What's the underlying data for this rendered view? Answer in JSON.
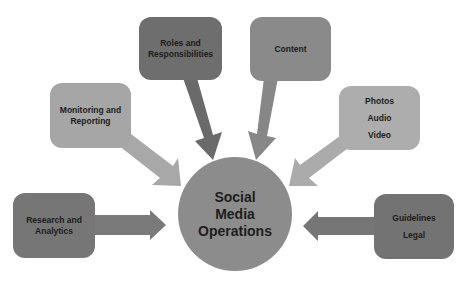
{
  "diagram": {
    "type": "hub-and-spoke",
    "center": {
      "label_lines": [
        "Social",
        "Media",
        "Operations"
      ],
      "color": "#8c8c8c"
    },
    "nodes": [
      {
        "id": "roles",
        "label_lines": [
          "Roles and",
          "Responsibilities"
        ],
        "color": "#6e6e6e",
        "arrow_color": "#6a6a6a"
      },
      {
        "id": "content",
        "label_lines": [
          "Content"
        ],
        "color": "#8a8a8a",
        "arrow_color": "#878787"
      },
      {
        "id": "monitoring",
        "label_lines": [
          "Monitoring and",
          "Reporting"
        ],
        "color": "#a6a6a6",
        "arrow_color": "#a8a8a8"
      },
      {
        "id": "media-types",
        "label_lines": [
          "Photos",
          "Audio",
          "Video"
        ],
        "color": "#adadad",
        "arrow_color": "#ababab"
      },
      {
        "id": "research",
        "label_lines": [
          "Research and",
          "Analytics"
        ],
        "color": "#767676",
        "arrow_color": "#7a7a7a"
      },
      {
        "id": "guidelines",
        "label_lines": [
          "Guidelines",
          "Legal"
        ],
        "color": "#737373",
        "arrow_color": "#767676"
      }
    ],
    "edges": [
      {
        "from": "roles",
        "to": "center",
        "direction": "inward"
      },
      {
        "from": "content",
        "to": "center",
        "direction": "inward"
      },
      {
        "from": "monitoring",
        "to": "center",
        "direction": "inward"
      },
      {
        "from": "media-types",
        "to": "center",
        "direction": "inward"
      },
      {
        "from": "research",
        "to": "center",
        "direction": "inward"
      },
      {
        "from": "guidelines",
        "to": "center",
        "direction": "inward"
      }
    ]
  }
}
